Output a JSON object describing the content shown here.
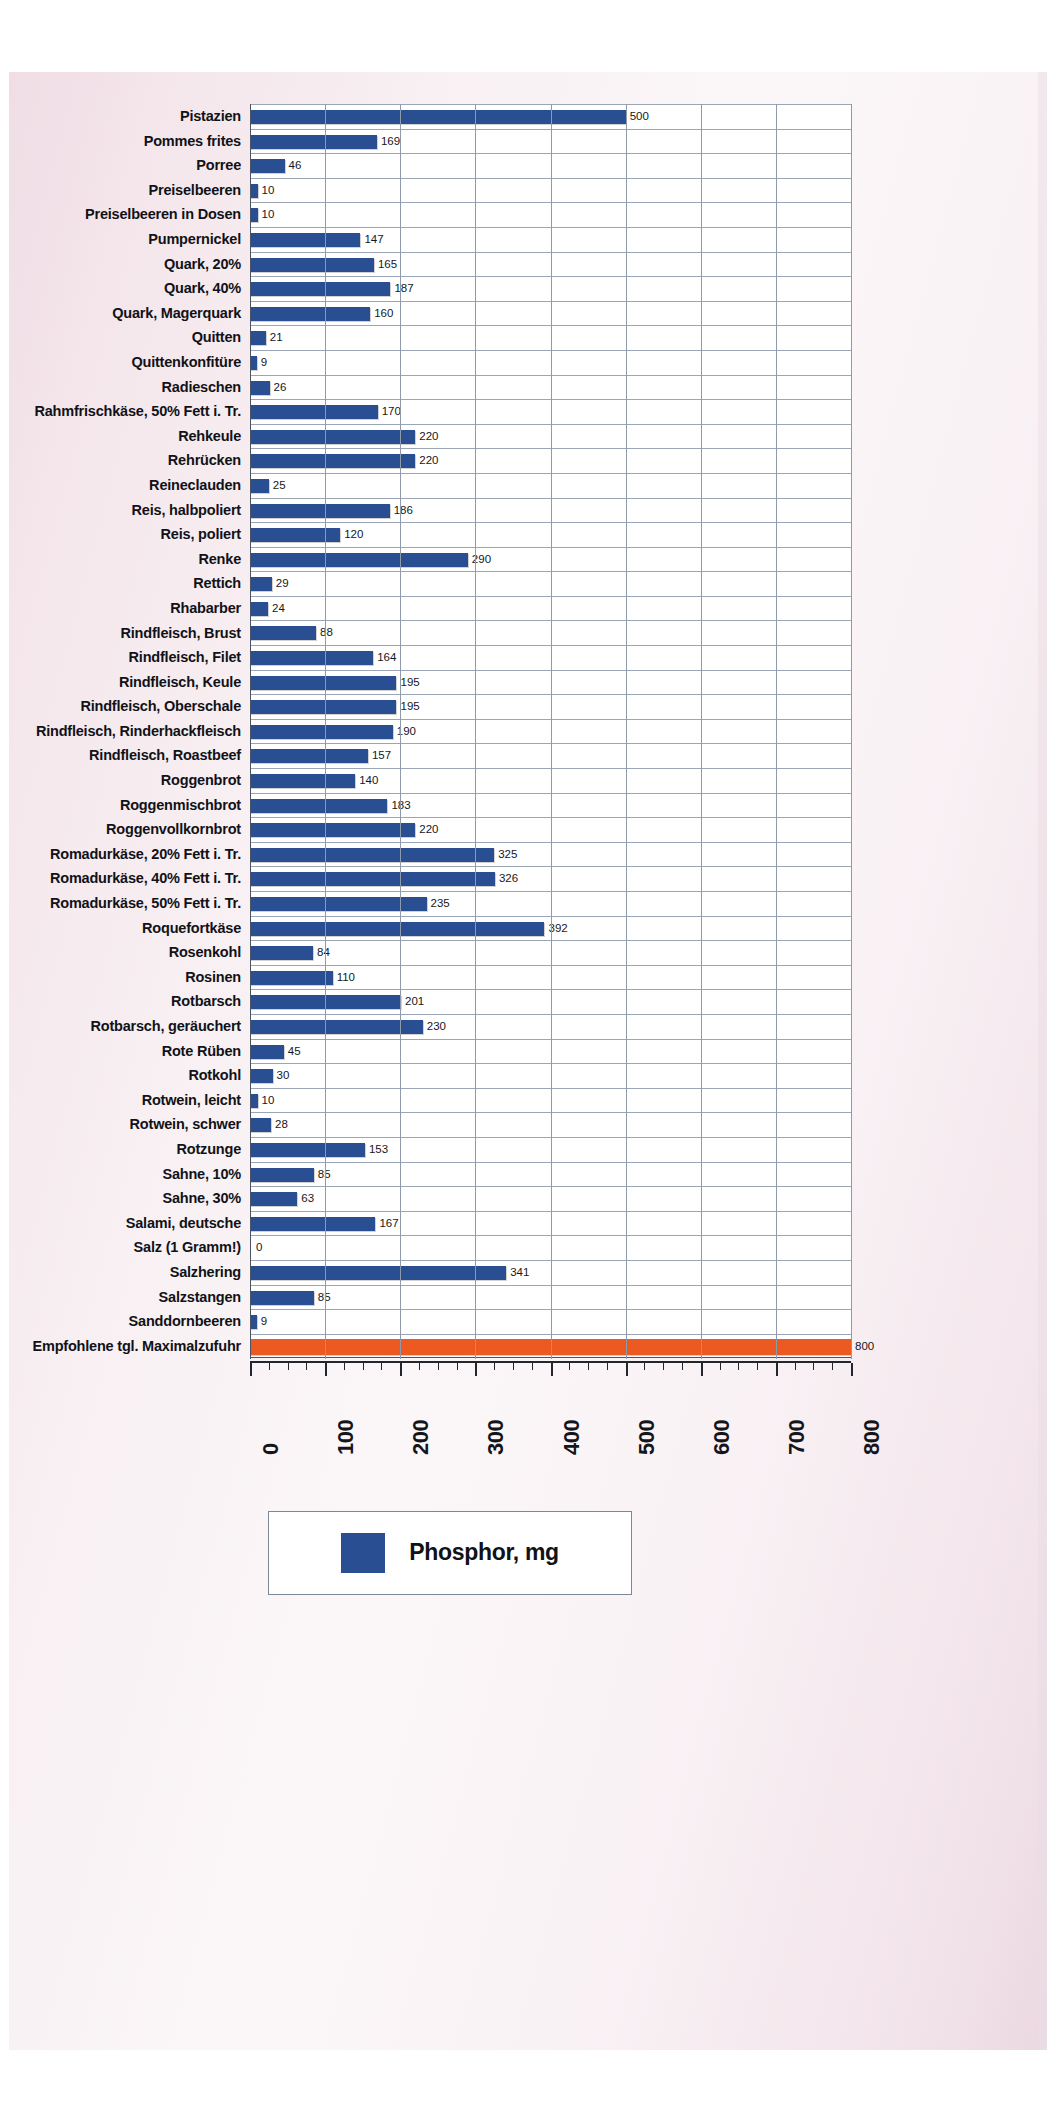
{
  "chart_data": {
    "type": "bar",
    "orientation": "horizontal",
    "title": "",
    "xlabel": "",
    "ylabel": "",
    "xlim": [
      0,
      800
    ],
    "xticks": [
      0,
      100,
      200,
      300,
      400,
      500,
      600,
      700,
      800
    ],
    "xtick_labels": [
      "0",
      "100",
      "200",
      "300",
      "400",
      "500",
      "600",
      "700",
      "800"
    ],
    "grid": true,
    "legend": {
      "position": "bottom",
      "label": "Phosphor, mg",
      "color": "#2a4e92"
    },
    "bar_color": "#2a4e92",
    "reference_bar_color": "#ec5a22",
    "unit": "mg",
    "categories": [
      "Pistazien",
      "Pommes frites",
      "Porree",
      "Preiselbeeren",
      "Preiselbeeren in Dosen",
      "Pumpernickel",
      "Quark, 20%",
      "Quark, 40%",
      "Quark, Magerquark",
      "Quitten",
      "Quittenkonfitüre",
      "Radieschen",
      "Rahmfrischkäse, 50% Fett i. Tr.",
      "Rehkeule",
      "Rehrücken",
      "Reineclauden",
      "Reis, halbpoliert",
      "Reis, poliert",
      "Renke",
      "Rettich",
      "Rhabarber",
      "Rindfleisch, Brust",
      "Rindfleisch, Filet",
      "Rindfleisch, Keule",
      "Rindfleisch, Oberschale",
      "Rindfleisch, Rinderhackfleisch",
      "Rindfleisch, Roastbeef",
      "Roggenbrot",
      "Roggenmischbrot",
      "Roggenvollkornbrot",
      "Romadurkäse, 20% Fett i. Tr.",
      "Romadurkäse, 40% Fett i. Tr.",
      "Romadurkäse, 50% Fett i. Tr.",
      "Roquefortkäse",
      "Rosenkohl",
      "Rosinen",
      "Rotbarsch",
      "Rotbarsch, geräuchert",
      "Rote Rüben",
      "Rotkohl",
      "Rotwein, leicht",
      "Rotwein, schwer",
      "Rotzunge",
      "Sahne, 10%",
      "Sahne, 30%",
      "Salami, deutsche",
      "Salz (1 Gramm!)",
      "Salzhering",
      "Salzstangen",
      "Sanddornbeeren",
      "Empfohlene tgl. Maximalzufuhr"
    ],
    "values": [
      500,
      169,
      46,
      10,
      10,
      147,
      165,
      187,
      160,
      21,
      9,
      26,
      170,
      220,
      220,
      25,
      186,
      120,
      290,
      29,
      24,
      88,
      164,
      195,
      195,
      190,
      157,
      140,
      183,
      220,
      325,
      326,
      235,
      392,
      84,
      110,
      201,
      230,
      45,
      30,
      10,
      28,
      153,
      85,
      63,
      167,
      0,
      341,
      85,
      9,
      800
    ],
    "value_labels": [
      "500",
      "169",
      "46",
      "10",
      "10",
      "147",
      "165",
      "187",
      "160",
      "21",
      "9",
      "26",
      "170",
      "220",
      "220",
      "25",
      "186",
      "120",
      "290",
      "29",
      "24",
      "88",
      "164",
      "195",
      "195",
      "190",
      "157",
      "140",
      "183",
      "220",
      "325",
      "326",
      "235",
      "392",
      "84",
      "110",
      "201",
      "230",
      "45",
      "30",
      "10",
      "28",
      "153",
      "85",
      "63",
      "167",
      "0",
      "341",
      "85",
      "9",
      "800"
    ],
    "reference_index": 50
  },
  "legend": {
    "label": "Phosphor, mg"
  }
}
